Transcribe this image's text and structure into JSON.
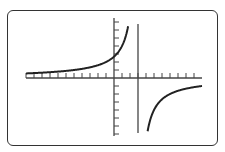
{
  "figure": {
    "colors": {
      "frame": "#333333",
      "axes": "#444444",
      "curve": "#222222",
      "background": "#ffffff"
    }
  },
  "chart_data": {
    "type": "line",
    "title": "",
    "xlabel": "",
    "ylabel": "",
    "grid": false,
    "axes": {
      "origin_px": [
        114,
        78
      ],
      "x_axis_px": [
        26,
        202
      ],
      "y_axis_px": [
        18,
        136
      ],
      "tick_spacing_px": 8,
      "x_ticks_left": 11,
      "x_ticks_right": 10,
      "y_ticks_up": 7,
      "y_ticks_down": 7
    },
    "vertical_asymptote": {
      "x_units": 3,
      "x_px": 138
    },
    "horizontal_asymptote": {
      "y_units": 0
    },
    "series": [
      {
        "name": "left branch",
        "x_range_units": [
          -11,
          2.8
        ],
        "formula": "y = -8/(x-3)"
      },
      {
        "name": "right branch",
        "x_range_units": [
          3.2,
          11
        ],
        "formula": "y = -8/(x-3)"
      }
    ]
  }
}
